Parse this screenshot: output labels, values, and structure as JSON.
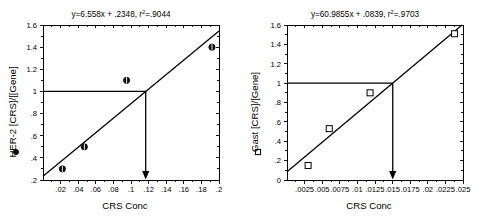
{
  "figure": {
    "panel_count": 2,
    "background_color": "#ffffff",
    "ink_color": "#000000"
  },
  "chart_data": [
    {
      "type": "scatter",
      "panel": "left",
      "title": "y=6.558x + .2348, r²=.9044",
      "title_parts": {
        "equation": "y=6.558x + .2348, r",
        "superscript": "2",
        "tail": "=.9044"
      },
      "xlabel": "CRS Conc",
      "ylabel": "HER-2 [CRS]/[[Gene]",
      "legend_marker": "filled-circle",
      "xlim": [
        0.0,
        0.2
      ],
      "ylim": [
        0.2,
        1.6
      ],
      "xticks": [
        0.02,
        0.04,
        0.06,
        0.08,
        0.1,
        0.12,
        0.14,
        0.16,
        0.18,
        0.2
      ],
      "xticklabels": [
        ".02",
        ".04",
        ".06",
        ".08",
        ".1",
        ".12",
        ".14",
        ".16",
        ".18",
        ".2"
      ],
      "yticks": [
        0.2,
        0.4,
        0.6,
        0.8,
        1.0,
        1.2,
        1.4,
        1.6
      ],
      "yticklabels": [
        ".2",
        ".4",
        ".6",
        ".8",
        "1",
        "1.2",
        "1.4",
        "1.6"
      ],
      "grid": false,
      "legend_position": "y-axis-label",
      "points": [
        {
          "x": 0.022,
          "y": 0.3
        },
        {
          "x": 0.047,
          "y": 0.5
        },
        {
          "x": 0.095,
          "y": 1.1
        },
        {
          "x": 0.192,
          "y": 1.4
        }
      ],
      "fit": {
        "slope": 6.558,
        "intercept": 0.2348,
        "r_squared": 0.9044
      },
      "reference": {
        "horizontal_y": 1.0,
        "intersection_x": 0.1167,
        "arrow": "down-to-x-axis"
      }
    },
    {
      "type": "scatter",
      "panel": "right",
      "title": "y=60.9855x + .0839, r²=.9703",
      "title_parts": {
        "equation": "y=60.9855x + .0839, r",
        "superscript": "2",
        "tail": "=.9703"
      },
      "xlabel": "CRS Conc",
      "ylabel": "Gast [CRS]/[Gene]",
      "legend_marker": "open-square",
      "xlim": [
        0.0,
        0.025
      ],
      "ylim": [
        0.0,
        1.6
      ],
      "xticks": [
        0.0025,
        0.005,
        0.0075,
        0.01,
        0.0125,
        0.015,
        0.0175,
        0.02,
        0.0225,
        0.025
      ],
      "xticklabels": [
        ".0025",
        ".005",
        ".0075",
        ".01",
        ".0125",
        ".015",
        ".0175",
        ".02",
        ".0225",
        ".025"
      ],
      "yticks": [
        0.0,
        0.2,
        0.4,
        0.6,
        0.8,
        1.0,
        1.2,
        1.4,
        1.6
      ],
      "yticklabels": [
        "0",
        ".2",
        ".4",
        ".6",
        ".8",
        "1",
        "1.2",
        "1.4",
        "1.6"
      ],
      "grid": false,
      "legend_position": "y-axis-label",
      "points": [
        {
          "x": 0.003,
          "y": 0.15
        },
        {
          "x": 0.006,
          "y": 0.53
        },
        {
          "x": 0.0118,
          "y": 0.9
        },
        {
          "x": 0.0238,
          "y": 1.51
        }
      ],
      "fit": {
        "slope": 60.9855,
        "intercept": 0.0839,
        "r_squared": 0.9703
      },
      "reference": {
        "horizontal_y": 1.0,
        "intersection_x": 0.01502,
        "arrow": "down-to-x-axis"
      }
    }
  ]
}
